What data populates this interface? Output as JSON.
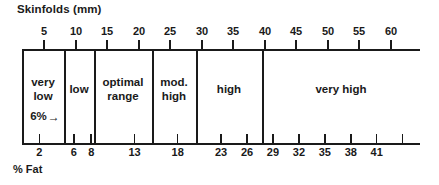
{
  "chart_data": {
    "type": "bar",
    "title": "Skinfolds (mm)",
    "subtitle": "",
    "xlabel": "% Fat",
    "ylabel": "",
    "orientation": "horizontal",
    "grid": false,
    "legend": false,
    "top_axis": {
      "name": "Skinfolds (mm)",
      "unit": "mm",
      "position": "top",
      "ticks": [
        5,
        10,
        15,
        20,
        25,
        30,
        35,
        40,
        45,
        50,
        55,
        60
      ],
      "tick_labels": [
        "5",
        "10",
        "15",
        "20",
        "25",
        "30",
        "35",
        "40",
        "45",
        "50",
        "55",
        "60"
      ],
      "range": [
        0,
        63
      ]
    },
    "bottom_axis": {
      "name": "% Fat",
      "unit": "%",
      "position": "bottom",
      "ticks": [
        2,
        6,
        8,
        13,
        18,
        23,
        26,
        29,
        32,
        35,
        38,
        41,
        44
      ],
      "tick_labels": [
        "2",
        "6",
        "8",
        "13",
        "18",
        "23",
        "26",
        "29",
        "32",
        "35",
        "38",
        "41",
        ""
      ],
      "range": [
        0,
        46
      ]
    },
    "categories": [
      {
        "label": "very low",
        "label_lines": [
          "very",
          "low"
        ],
        "fat_min": 0,
        "fat_max": 6,
        "note": "6%"
      },
      {
        "label": "low",
        "label_lines": [
          "low"
        ],
        "fat_min": 6,
        "fat_max": 8,
        "note": ""
      },
      {
        "label": "optimal range",
        "label_lines": [
          "optimal",
          "range"
        ],
        "fat_min": 8,
        "fat_max": 18,
        "note": ""
      },
      {
        "label": "mod. high",
        "label_lines": [
          "mod.",
          "high"
        ],
        "fat_min": 18,
        "fat_max": 23,
        "note": ""
      },
      {
        "label": "high",
        "label_lines": [
          "high"
        ],
        "fat_min": 23,
        "fat_max": 26,
        "note": ""
      },
      {
        "label": "very high",
        "label_lines": [
          "very high"
        ],
        "fat_min": 26,
        "fat_max": 46,
        "note": ""
      }
    ],
    "annotations": [
      {
        "text": "6%",
        "icon": "right-arrow",
        "target_category": "very low"
      }
    ]
  },
  "labels": {
    "top_title": "Skinfolds (mm)",
    "bottom_title": "% Fat",
    "annotation_six_percent": "6%",
    "arrow_glyph": "→",
    "cat_very_low_1": "very",
    "cat_very_low_2": "low",
    "cat_low": "low",
    "cat_optimal_1": "optimal",
    "cat_optimal_2": "range",
    "cat_mod_high_1": "mod.",
    "cat_mod_high_2": "high",
    "cat_high": "high",
    "cat_very_high": "very high",
    "top_ticks": [
      "5",
      "10",
      "15",
      "20",
      "25",
      "30",
      "35",
      "40",
      "45",
      "50",
      "55",
      "60"
    ],
    "bottom_ticks": [
      "2",
      "6",
      "8",
      "13",
      "18",
      "23",
      "26",
      "29",
      "32",
      "35",
      "38",
      "41"
    ]
  },
  "colors": {
    "ink": "#1a1a1a",
    "background": "#ffffff"
  }
}
